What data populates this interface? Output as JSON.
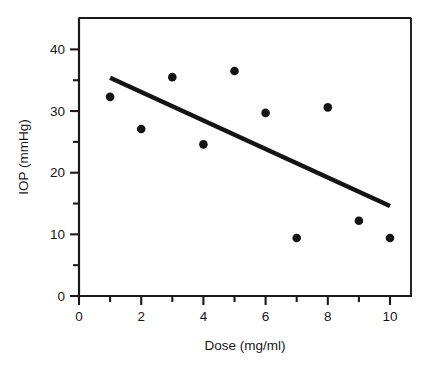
{
  "chart_data": {
    "type": "scatter",
    "title": "",
    "xlabel": "Dose (mg/ml)",
    "ylabel": "IOP (mmHg)",
    "xlim": [
      0,
      11
    ],
    "ylim": [
      0,
      45
    ],
    "grid": false,
    "legend": null,
    "x": [
      1,
      2,
      3,
      4,
      5,
      6,
      7,
      8,
      9,
      10
    ],
    "y": [
      32.3,
      27.1,
      35.5,
      24.6,
      36.5,
      29.7,
      9.4,
      30.6,
      12.2,
      9.4
    ],
    "points": [
      {
        "x": 1,
        "y": 32.3
      },
      {
        "x": 2,
        "y": 27.1
      },
      {
        "x": 3,
        "y": 35.5
      },
      {
        "x": 4,
        "y": 24.6
      },
      {
        "x": 5,
        "y": 36.5
      },
      {
        "x": 6,
        "y": 29.7
      },
      {
        "x": 7,
        "y": 9.4
      },
      {
        "x": 8,
        "y": 30.6
      },
      {
        "x": 9,
        "y": 12.2
      },
      {
        "x": 10,
        "y": 9.4
      }
    ],
    "trendline": {
      "name": "regression-line",
      "x_start": 1,
      "y_start": 35.4,
      "x_end": 10,
      "y_end": 14.6
    },
    "x_ticks_major": [
      0,
      2,
      4,
      6,
      8,
      10
    ],
    "x_ticks_major_labels": [
      "0",
      "2",
      "4",
      "6",
      "8",
      "10"
    ],
    "x_ticks_minor": [
      1,
      3,
      5,
      7,
      9
    ],
    "y_ticks_major": [
      0,
      10,
      20,
      30,
      40
    ],
    "y_ticks_major_labels": [
      "0",
      "10",
      "20",
      "30",
      "40"
    ],
    "y_ticks_minor": [
      5,
      15,
      25,
      35
    ],
    "colors": {
      "point": "#141414",
      "line": "#141414",
      "axis": "#1a1a1a",
      "background": "#ffffff"
    }
  }
}
